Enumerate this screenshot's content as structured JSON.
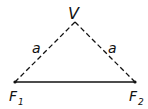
{
  "diagram": {
    "type": "geometry",
    "vertex": {
      "label": "V",
      "x": 75,
      "y": 22
    },
    "focus1": {
      "label": "F",
      "subscript": "1",
      "x": 15,
      "y": 82
    },
    "focus2": {
      "label": "F",
      "subscript": "2",
      "x": 135,
      "y": 82
    },
    "side_left_label": "a",
    "side_right_label": "a",
    "colors": {
      "stroke": "#111111",
      "background": "#ffffff"
    }
  }
}
